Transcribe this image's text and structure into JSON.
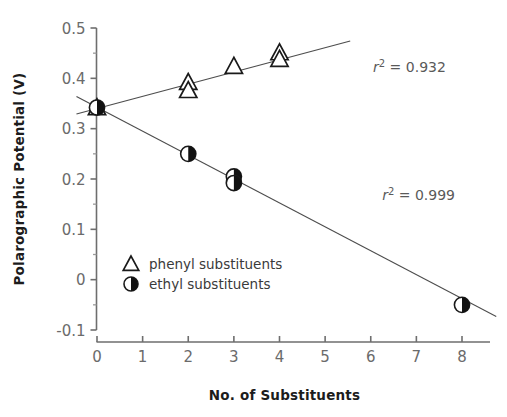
{
  "chart_data": {
    "type": "scatter",
    "title": "",
    "xlabel": "No. of Substituents",
    "ylabel": "Polarographic Potential (V)",
    "xlim": [
      0,
      8.6
    ],
    "ylim": [
      -0.1,
      0.5
    ],
    "xticks": [
      "0",
      "1",
      "2",
      "3",
      "4",
      "5",
      "6",
      "7",
      "8"
    ],
    "xtick_values": [
      0,
      1,
      2,
      3,
      4,
      5,
      6,
      7,
      8
    ],
    "yticks": [
      "0.5",
      "0.4",
      "0.3",
      "0.2",
      "0.1",
      "0",
      "-0.1"
    ],
    "ytick_values": [
      0.5,
      0.4,
      0.3,
      0.2,
      0.1,
      0,
      -0.1
    ],
    "yminor_values": [
      0.45,
      0.35,
      0.25,
      0.15,
      0.05,
      -0.05
    ],
    "grid": false,
    "legend_position": "lower-left-inside",
    "series": [
      {
        "name": "phenyl substituents",
        "marker": "open-triangle",
        "points": [
          {
            "x": 0,
            "y": 0.342
          },
          {
            "x": 2,
            "y": 0.392
          },
          {
            "x": 2,
            "y": 0.376
          },
          {
            "x": 3,
            "y": 0.424
          },
          {
            "x": 4,
            "y": 0.451
          },
          {
            "x": 4,
            "y": 0.438
          }
        ],
        "fit_label": "r2 = 0.932",
        "fit_r2": 0.932,
        "fit_line": {
          "x1": -0.45,
          "y1": 0.329,
          "x2": 5.55,
          "y2": 0.474
        }
      },
      {
        "name": "ethyl substituents",
        "marker": "half-filled-circle",
        "points": [
          {
            "x": 0,
            "y": 0.342
          },
          {
            "x": 2,
            "y": 0.25
          },
          {
            "x": 3,
            "y": 0.205
          },
          {
            "x": 3,
            "y": 0.192
          },
          {
            "x": 8,
            "y": -0.05
          }
        ],
        "fit_label": "r2 = 0.999",
        "fit_r2": 0.999,
        "fit_line": {
          "x1": -0.45,
          "y1": 0.364,
          "x2": 8.75,
          "y2": -0.073
        }
      }
    ],
    "annotations": [
      {
        "name": "r2-phenyl",
        "prefix": "r",
        "sup": "2",
        "eq": " = ",
        "value": "0.932",
        "x": 6.05,
        "y": 0.412
      },
      {
        "name": "r2-ethyl",
        "prefix": "r",
        "sup": "2",
        "eq": " = ",
        "value": "0.999",
        "x": 6.25,
        "y": 0.158
      }
    ],
    "legend": [
      {
        "label": "phenyl substituents",
        "marker": "open-triangle"
      },
      {
        "label": "ethyl substituents",
        "marker": "half-filled-circle"
      }
    ],
    "colors": {
      "axis": "#6e6e6e",
      "marker_stroke": "#1a1a1a",
      "marker_fill": "#111111",
      "trend": "#4d4d4d",
      "ticklabel": "#6b6b6b",
      "axistitle": "#1c1c1c",
      "annotation": "#5a5a5a",
      "background": "#ffffff"
    }
  }
}
